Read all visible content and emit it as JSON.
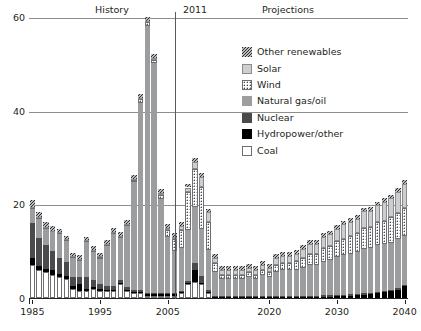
{
  "header": {
    "history_label": "History",
    "year_divider_label": "2011",
    "projections_label": "Projections"
  },
  "legend": {
    "items": [
      {
        "label": "Other renewables",
        "swatch": "hatch-diagonal-swatch",
        "color": "#2e2e30"
      },
      {
        "label": "Solar",
        "swatch": "light-gray-swatch",
        "color": "#cdcecf"
      },
      {
        "label": "Wind",
        "swatch": "dotted-swatch",
        "color": "#ffffff"
      },
      {
        "label": "Natural gas/oil",
        "swatch": "mid-gray-swatch",
        "color": "#9c9d9f"
      },
      {
        "label": "Nuclear",
        "swatch": "dark-gray-swatch",
        "color": "#4a4a4c"
      },
      {
        "label": "Hydropower/other",
        "swatch": "black-swatch",
        "color": "#000000"
      },
      {
        "label": "Coal",
        "swatch": "white-swatch",
        "color": "#ffffff"
      }
    ]
  },
  "chart_data": {
    "type": "bar",
    "title": "",
    "subtitle": "",
    "xlabel": "",
    "ylabel": "",
    "stacked": true,
    "grid": true,
    "legend_position": "top-right",
    "ylim": [
      0,
      60
    ],
    "yticks": [
      0,
      20,
      40,
      60
    ],
    "xlim": [
      1985,
      2040
    ],
    "xticks": [
      1985,
      1995,
      2005,
      2020,
      2030,
      2040
    ],
    "annotations": [
      {
        "text": "History",
        "x_range": [
          1985,
          2011
        ]
      },
      {
        "text": "2011",
        "x": 2011,
        "type": "vertical-divider"
      },
      {
        "text": "Projections",
        "x_range": [
          2011,
          2040
        ]
      }
    ],
    "series_order": [
      "Coal",
      "Hydropower/other",
      "Nuclear",
      "Natural gas/oil",
      "Wind",
      "Solar",
      "Other renewables"
    ],
    "categories": [
      1985,
      1986,
      1987,
      1988,
      1989,
      1990,
      1991,
      1992,
      1993,
      1994,
      1995,
      1996,
      1997,
      1998,
      1999,
      2000,
      2001,
      2002,
      2003,
      2004,
      2005,
      2006,
      2007,
      2008,
      2009,
      2010,
      2011,
      2012,
      2013,
      2014,
      2015,
      2016,
      2017,
      2018,
      2019,
      2020,
      2021,
      2022,
      2023,
      2024,
      2025,
      2026,
      2027,
      2028,
      2029,
      2030,
      2031,
      2032,
      2033,
      2034,
      2035,
      2036,
      2037,
      2038,
      2039,
      2040
    ],
    "series": [
      {
        "name": "Coal",
        "values": [
          7.0,
          6.0,
          5.5,
          5.0,
          4.5,
          4.0,
          2.0,
          1.5,
          1.5,
          2.0,
          1.5,
          1.5,
          1.5,
          3.0,
          1.5,
          1.0,
          1.0,
          0.5,
          0.5,
          0.5,
          0.5,
          0.5,
          1.0,
          3.0,
          3.5,
          3.0,
          1.0,
          0.0,
          0.0,
          0.0,
          0.0,
          0.0,
          0.0,
          0.0,
          0.0,
          0.0,
          0.0,
          0.0,
          0.0,
          0.0,
          0.0,
          0.0,
          0.0,
          0.0,
          0.0,
          0.0,
          0.0,
          0.0,
          0.0,
          0.0,
          0.0,
          0.0,
          0.0,
          0.0,
          0.0,
          0.0
        ]
      },
      {
        "name": "Hydropower/other",
        "values": [
          1.5,
          0.8,
          0.8,
          1.0,
          0.6,
          0.6,
          0.5,
          1.5,
          0.4,
          0.4,
          0.4,
          0.3,
          0.3,
          0.3,
          0.3,
          0.3,
          0.3,
          0.3,
          0.3,
          0.3,
          0.3,
          0.3,
          0.3,
          0.3,
          2.5,
          0.3,
          0.3,
          0.2,
          0.2,
          0.2,
          0.2,
          0.2,
          0.2,
          0.2,
          0.2,
          0.2,
          0.2,
          0.2,
          0.2,
          0.2,
          0.2,
          0.2,
          0.2,
          0.3,
          0.3,
          0.4,
          0.4,
          0.5,
          0.6,
          0.7,
          0.8,
          1.0,
          1.2,
          1.5,
          1.8,
          2.5
        ]
      },
      {
        "name": "Nuclear",
        "values": [
          7.5,
          6.0,
          5.0,
          4.0,
          3.5,
          3.0,
          2.0,
          1.5,
          2.5,
          1.5,
          1.0,
          0.8,
          0.8,
          0.5,
          0.5,
          0.4,
          0.4,
          0.3,
          0.3,
          0.3,
          0.3,
          0.3,
          0.3,
          0.3,
          1.5,
          1.5,
          0.5,
          0.3,
          0.3,
          0.3,
          0.3,
          0.3,
          0.3,
          0.3,
          0.3,
          0.3,
          0.3,
          0.3,
          0.3,
          0.3,
          0.3,
          0.3,
          0.3,
          0.3,
          0.3,
          0.3,
          0.3,
          0.3,
          0.3,
          0.3,
          0.3,
          0.3,
          0.3,
          0.3,
          0.3,
          0.3
        ]
      },
      {
        "name": "Natural gas/oil",
        "values": [
          3.0,
          4.0,
          3.5,
          4.0,
          5.0,
          4.5,
          4.0,
          3.5,
          7.5,
          6.0,
          5.5,
          8.5,
          11.0,
          9.0,
          13.0,
          23.0,
          40.0,
          57.0,
          49.0,
          20.0,
          12.0,
          9.0,
          9.0,
          11.0,
          12.0,
          10.0,
          8.5,
          5.0,
          3.5,
          3.5,
          3.5,
          3.5,
          4.0,
          3.5,
          4.5,
          4.0,
          5.0,
          5.5,
          5.5,
          5.5,
          6.0,
          6.5,
          6.5,
          7.0,
          7.5,
          8.0,
          8.5,
          8.5,
          9.0,
          9.5,
          9.5,
          10.0,
          10.0,
          10.0,
          10.5,
          10.5
        ]
      },
      {
        "name": "Wind",
        "values": [
          0.2,
          0.2,
          0.2,
          0.2,
          0.2,
          0.2,
          0.2,
          0.2,
          0.2,
          0.2,
          0.3,
          0.3,
          0.3,
          0.3,
          0.3,
          0.5,
          0.8,
          0.8,
          0.8,
          1.0,
          1.5,
          2.5,
          4.0,
          8.0,
          8.0,
          9.0,
          6.0,
          2.0,
          1.0,
          1.0,
          1.0,
          1.0,
          1.0,
          1.0,
          1.0,
          1.0,
          1.5,
          1.5,
          1.5,
          2.0,
          2.0,
          2.5,
          2.5,
          3.0,
          3.0,
          3.5,
          3.5,
          4.0,
          4.0,
          4.5,
          4.5,
          5.0,
          5.0,
          5.5,
          5.5,
          6.0
        ]
      },
      {
        "name": "Solar",
        "values": [
          0.2,
          0.2,
          0.2,
          0.2,
          0.2,
          0.2,
          0.2,
          0.2,
          0.2,
          0.2,
          0.2,
          0.2,
          0.2,
          0.2,
          0.2,
          0.2,
          0.3,
          0.3,
          0.3,
          0.3,
          0.3,
          0.5,
          0.8,
          1.0,
          1.5,
          2.0,
          2.0,
          1.0,
          1.0,
          1.0,
          1.0,
          1.0,
          1.0,
          1.0,
          1.0,
          1.0,
          1.5,
          1.5,
          1.5,
          1.5,
          2.0,
          2.0,
          2.0,
          2.5,
          2.5,
          2.5,
          3.0,
          3.0,
          3.0,
          3.5,
          3.5,
          3.5,
          4.0,
          4.0,
          4.5,
          5.0
        ]
      },
      {
        "name": "Other renewables",
        "values": [
          1.5,
          1.2,
          1.0,
          1.0,
          0.8,
          0.8,
          0.8,
          0.8,
          0.8,
          0.8,
          0.8,
          0.8,
          0.8,
          0.8,
          0.8,
          0.8,
          0.8,
          0.8,
          0.8,
          0.8,
          0.8,
          0.8,
          0.8,
          0.8,
          0.8,
          0.8,
          0.8,
          0.8,
          0.8,
          0.8,
          0.8,
          0.8,
          0.8,
          0.8,
          0.8,
          0.8,
          0.8,
          0.8,
          0.8,
          0.8,
          0.8,
          0.8,
          0.8,
          0.8,
          0.8,
          0.8,
          0.8,
          0.8,
          0.8,
          0.8,
          0.8,
          0.8,
          0.8,
          0.8,
          0.8,
          0.8
        ]
      }
    ]
  }
}
